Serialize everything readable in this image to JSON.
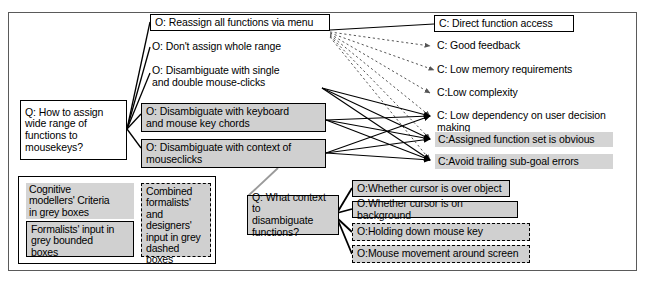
{
  "diagram": {
    "colors": {
      "grey_fill": "#d4d4d4",
      "border": "#000000",
      "frame": "#5a5a5a",
      "dotted_edge": "#555555",
      "solid_edge": "#000000"
    },
    "questions": [
      {
        "id": "q-main",
        "label": "Q: How to assign\n    wide range of\n    functions to\n    mousekeys?",
        "style": "boxwhite"
      },
      {
        "id": "q-context",
        "label": "Q: What context to\n     disambiguate\n     functions?",
        "style": "greybox"
      }
    ],
    "options": [
      {
        "id": "o-reassign",
        "label": "O: Reassign all functions via menu",
        "style": "boxwhite"
      },
      {
        "id": "o-dontassign",
        "label": "O: Don't assign whole range",
        "style": "plain"
      },
      {
        "id": "o-singledouble",
        "label": "O: Disambiguate with single\n     and double mouse-clicks",
        "style": "plain"
      },
      {
        "id": "o-keychords",
        "label": "O: Disambiguate with keyboard\n     and mouse key chords",
        "style": "greybox"
      },
      {
        "id": "o-context",
        "label": "O: Disambiguate with context of\n     mouseclicks",
        "style": "greybox"
      },
      {
        "id": "o-overobject",
        "label": "O:Whether cursor is over object",
        "style": "greybox"
      },
      {
        "id": "o-onbackground",
        "label": "O:Whether cursor is on background",
        "style": "greybox"
      },
      {
        "id": "o-holdingkey",
        "label": "O:Holding down mouse key",
        "style": "greydash"
      },
      {
        "id": "o-mousemovement",
        "label": "O:Mouse movement around screen",
        "style": "greydash"
      }
    ],
    "criteria": [
      {
        "id": "c-direct",
        "label": "C: Direct function access",
        "style": "boxwhite"
      },
      {
        "id": "c-feedback",
        "label": "C: Good feedback",
        "style": "plain"
      },
      {
        "id": "c-memory",
        "label": "C: Low memory requirements",
        "style": "plain"
      },
      {
        "id": "c-complexity",
        "label": "C:Low complexity",
        "style": "plain"
      },
      {
        "id": "c-dependency",
        "label": "C: Low dependency on user decision making",
        "style": "plain"
      },
      {
        "id": "c-obvious",
        "label": "C:Assigned function set is obvious",
        "style": "grey"
      },
      {
        "id": "c-subgoal",
        "label": "C:Avoid trailing sub-goal errors",
        "style": "grey"
      }
    ],
    "legend": {
      "items": [
        {
          "id": "legend-grey",
          "label": "Cognitive\nmodellers' Criteria\nin grey boxes",
          "style": "grey"
        },
        {
          "id": "legend-greybox",
          "label": "Formalists' input in\ngrey bounded\nboxes",
          "style": "greybox"
        },
        {
          "id": "legend-greydash",
          "label": "Combined\nformalists'\nand designers'\ninput in grey\ndashed boxes",
          "style": "greydash"
        }
      ]
    }
  }
}
